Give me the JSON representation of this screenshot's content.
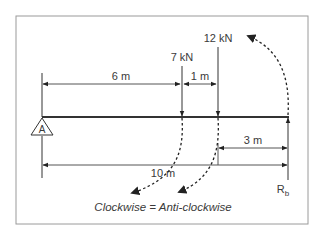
{
  "diagram": {
    "support_a": {
      "label": "A"
    },
    "reaction_b": {
      "label": "R",
      "subscript": "b"
    },
    "forces": [
      {
        "label": "7 kN"
      },
      {
        "label": "12 kN"
      }
    ],
    "dimensions": {
      "a_to_7kn": "6 m",
      "7kn_to_12kn": "1 m",
      "12kn_to_b": "3 m",
      "a_to_b": "10 m"
    },
    "caption": "Clockwise = Anti-clockwise",
    "colors": {
      "line": "#3a3a3a",
      "border": "#9a9a9a",
      "background": "#ffffff"
    }
  }
}
